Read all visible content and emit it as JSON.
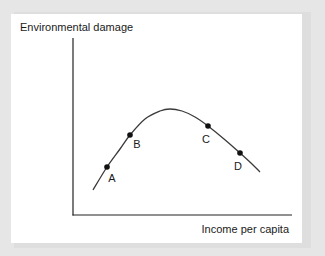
{
  "chart_data": {
    "type": "line",
    "title": "",
    "ylabel": "Environmental damage",
    "xlabel": "Income per capita",
    "grid": false,
    "legend": null,
    "curve_pixels": [
      [
        93,
        190
      ],
      [
        107,
        167
      ],
      [
        120,
        149
      ],
      [
        130,
        135
      ],
      [
        145,
        119
      ],
      [
        160,
        111
      ],
      [
        170,
        109
      ],
      [
        182,
        111
      ],
      [
        195,
        117
      ],
      [
        208,
        126
      ],
      [
        224,
        139
      ],
      [
        240,
        153
      ],
      [
        252,
        164
      ],
      [
        260,
        172
      ]
    ],
    "points": [
      {
        "label": "A",
        "x": 107,
        "y": 167,
        "label_x": 112,
        "label_y": 182
      },
      {
        "label": "B",
        "x": 130,
        "y": 135,
        "label_x": 137,
        "label_y": 148
      },
      {
        "label": "C",
        "x": 208,
        "y": 126,
        "label_x": 206,
        "label_y": 143
      },
      {
        "label": "D",
        "x": 240,
        "y": 153,
        "label_x": 238,
        "label_y": 170
      }
    ],
    "axes": {
      "origin": [
        73,
        215
      ],
      "y_top": 38,
      "x_right": 292
    }
  },
  "colors": {
    "line": "#3a3a3a",
    "axis": "#222222",
    "point": "#111111",
    "text": "#1a1a1a"
  }
}
